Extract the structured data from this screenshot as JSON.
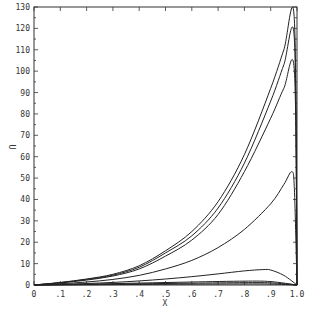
{
  "chart_data": {
    "type": "line",
    "title": "",
    "xlabel": "X",
    "ylabel": "U",
    "xlim": [
      0,
      1.0
    ],
    "ylim": [
      0,
      130
    ],
    "grid": false,
    "legend": "none",
    "x_ticks": [
      0,
      0.1,
      0.2,
      0.3,
      0.4,
      0.5,
      0.6,
      0.7,
      0.8,
      0.9,
      1.0
    ],
    "x_tick_labels": [
      "0",
      ".1",
      ".2",
      ".3",
      ".4",
      ".5",
      ".6",
      ".7",
      ".8",
      ".9",
      "1.0"
    ],
    "y_ticks": [
      0,
      10,
      20,
      30,
      40,
      50,
      60,
      70,
      80,
      90,
      100,
      110,
      120,
      130
    ],
    "y_tick_labels": [
      "0",
      "10",
      "20",
      "30",
      "40",
      "50",
      "60",
      "70",
      "80",
      "90",
      "100",
      "110",
      "120",
      "130"
    ],
    "series": [
      {
        "name": "curve-1",
        "x": [
          0,
          0.1,
          0.2,
          0.3,
          0.4,
          0.5,
          0.6,
          0.7,
          0.8,
          0.9,
          0.95,
          0.99,
          1.0
        ],
        "values": [
          0,
          1.2,
          2.8,
          5,
          9,
          16,
          25,
          39,
          61,
          92,
          110,
          124,
          0
        ]
      },
      {
        "name": "curve-2",
        "x": [
          0,
          0.1,
          0.2,
          0.3,
          0.4,
          0.5,
          0.6,
          0.7,
          0.8,
          0.9,
          0.95,
          0.99,
          1.0
        ],
        "values": [
          0,
          1.1,
          2.6,
          4.6,
          8.3,
          15,
          23,
          36,
          57,
          86,
          103,
          115,
          0
        ]
      },
      {
        "name": "curve-3",
        "x": [
          0,
          0.1,
          0.2,
          0.3,
          0.4,
          0.5,
          0.6,
          0.7,
          0.8,
          0.9,
          0.95,
          0.99,
          1.0
        ],
        "values": [
          0,
          1.0,
          2.3,
          4.2,
          7.5,
          13.5,
          21,
          33,
          53,
          78,
          92,
          100,
          0
        ]
      },
      {
        "name": "curve-4",
        "x": [
          0,
          0.1,
          0.2,
          0.3,
          0.4,
          0.5,
          0.6,
          0.7,
          0.8,
          0.9,
          0.95,
          0.98,
          0.99,
          1.0
        ],
        "values": [
          0,
          0.6,
          1.4,
          2.6,
          4.5,
          7.5,
          11.5,
          17.5,
          26,
          38,
          47,
          53,
          45,
          0
        ]
      },
      {
        "name": "curve-5",
        "x": [
          0,
          0.1,
          0.2,
          0.3,
          0.4,
          0.5,
          0.6,
          0.7,
          0.8,
          0.87,
          0.9,
          0.95,
          1.0
        ],
        "values": [
          0,
          0.3,
          0.7,
          1.2,
          1.9,
          2.8,
          3.9,
          5.2,
          6.6,
          7.2,
          7.0,
          4.5,
          0
        ]
      },
      {
        "name": "curve-6",
        "x": [
          0,
          0.2,
          0.4,
          0.6,
          0.8,
          0.9,
          1.0
        ],
        "values": [
          0,
          0.4,
          0.9,
          1.4,
          1.8,
          1.6,
          0
        ]
      },
      {
        "name": "curve-7",
        "x": [
          0,
          0.2,
          0.4,
          0.6,
          0.8,
          0.9,
          1.0
        ],
        "values": [
          0,
          0.25,
          0.55,
          0.85,
          1.1,
          1.0,
          0
        ]
      },
      {
        "name": "curve-8",
        "x": [
          0,
          0.2,
          0.4,
          0.6,
          0.8,
          0.9,
          1.0
        ],
        "values": [
          0,
          0.1,
          0.25,
          0.4,
          0.5,
          0.45,
          0
        ]
      }
    ]
  },
  "plot": {
    "left": 34,
    "top": 7,
    "right": 297,
    "bottom": 285,
    "line_color": "#222222",
    "axis_color": "#333333"
  }
}
